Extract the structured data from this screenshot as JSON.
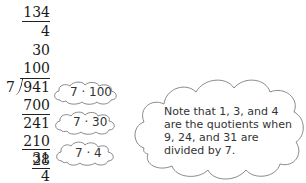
{
  "division": {
    "divisor": "7",
    "dividend": "941",
    "quotient_total": "134",
    "partial_quotients": [
      "4",
      "30",
      "100"
    ],
    "steps": [
      {
        "subtract": "700",
        "remainder": "241",
        "annotation": "7 · 100"
      },
      {
        "subtract": "210",
        "remainder": "31",
        "annotation": "7 · 30"
      },
      {
        "subtract": "28",
        "remainder": "4",
        "annotation": "7 · 4"
      }
    ]
  },
  "note": {
    "lines": [
      "Note that 1, 3, and 4",
      "are the quotients when",
      "9, 24, and 31 are",
      "divided by 7."
    ]
  },
  "colors": {
    "text": "#1a1a1a",
    "cloud_outline": "#8a8a8a"
  }
}
